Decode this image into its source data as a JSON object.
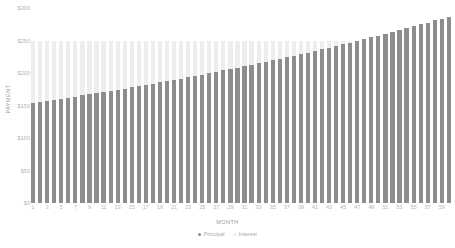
{
  "chart_data": {
    "type": "bar",
    "subtype": "stacked-bar",
    "title": "",
    "xlabel": "MONTH",
    "ylabel": "PAYMENT",
    "ylim": [
      0,
      300
    ],
    "y_ticks": [
      0,
      50,
      100,
      150,
      200,
      250,
      300
    ],
    "y_tick_labels": [
      "$0",
      "$50",
      "$100",
      "$150",
      "$200",
      "$250",
      "$300"
    ],
    "grid": false,
    "legend_position": "bottom-center",
    "legend": [
      "Principal",
      "Interest"
    ],
    "x_tick_labels": [
      "1",
      "3",
      "5",
      "7",
      "9",
      "11",
      "13",
      "15",
      "17",
      "19",
      "21",
      "23",
      "25",
      "27",
      "29",
      "31",
      "33",
      "35",
      "37",
      "39",
      "41",
      "43",
      "45",
      "47",
      "49",
      "51",
      "53",
      "55",
      "57",
      "59"
    ],
    "categories": [
      1,
      2,
      3,
      4,
      5,
      6,
      7,
      8,
      9,
      10,
      11,
      12,
      13,
      14,
      15,
      16,
      17,
      18,
      19,
      20,
      21,
      22,
      23,
      24,
      25,
      26,
      27,
      28,
      29,
      30,
      31,
      32,
      33,
      34,
      35,
      36,
      37,
      38,
      39,
      40,
      41,
      42,
      43,
      44,
      45,
      46,
      47,
      48,
      49,
      50,
      51,
      52,
      53,
      54,
      55,
      56,
      57,
      58,
      59,
      60
    ],
    "series": [
      {
        "name": "Principal",
        "color": "#8d8d8d",
        "values": [
          154.0,
          155.6,
          157.2,
          158.8,
          160.4,
          162.1,
          163.8,
          165.5,
          167.2,
          168.9,
          170.7,
          172.5,
          174.3,
          176.1,
          177.9,
          179.8,
          181.7,
          183.6,
          185.5,
          187.5,
          189.4,
          191.4,
          193.4,
          195.5,
          197.5,
          199.6,
          201.7,
          203.9,
          206.0,
          208.2,
          210.4,
          212.7,
          214.9,
          217.2,
          219.5,
          221.9,
          224.2,
          226.6,
          229.0,
          231.5,
          233.9,
          236.4,
          239.0,
          241.5,
          244.1,
          246.7,
          249.4,
          252.1,
          254.8,
          257.5,
          260.3,
          263.1,
          266.0,
          268.9,
          271.8,
          274.7,
          277.7,
          280.8,
          283.8,
          286.9
        ]
      },
      {
        "name": "Interest",
        "color": "#ededed",
        "values": [
          96.0,
          94.4,
          92.8,
          91.2,
          89.6,
          87.9,
          86.2,
          84.5,
          82.8,
          81.1,
          79.3,
          77.5,
          75.7,
          73.9,
          72.1,
          70.2,
          68.3,
          66.4,
          64.5,
          62.5,
          60.6,
          58.6,
          56.6,
          54.5,
          52.5,
          50.4,
          48.3,
          46.1,
          44.0,
          41.8,
          39.6,
          37.3,
          35.1,
          32.8,
          30.5,
          28.1,
          25.8,
          23.4,
          21.0,
          18.5,
          16.1,
          13.6,
          11.0,
          8.5,
          5.9,
          3.3,
          0.6,
          0.0,
          0.0,
          0.0,
          0.0,
          0.0,
          0.0,
          0.0,
          0.0,
          0.0,
          0.0,
          0.0,
          0.0,
          0.0
        ]
      }
    ],
    "totals": [
      250.0,
      250.0,
      250.0,
      250.0,
      250.0,
      250.0,
      250.0,
      250.0,
      250.0,
      250.0,
      250.0,
      250.0,
      250.0,
      250.0,
      250.0,
      250.0,
      250.0,
      250.0,
      250.0,
      250.0,
      250.0,
      250.0,
      250.0,
      250.0,
      250.0,
      250.0,
      250.0,
      250.0,
      250.0,
      250.0,
      250.0,
      250.0,
      250.0,
      250.0,
      250.0,
      250.0,
      250.0,
      250.0,
      250.0,
      250.0,
      250.0,
      250.0,
      250.0,
      250.0,
      250.0,
      250.0,
      250.0,
      252.1,
      254.8,
      257.5,
      260.3,
      263.1,
      266.0,
      268.9,
      271.8,
      274.7,
      277.7,
      280.8,
      283.8,
      286.9
    ]
  },
  "colors": {
    "principal": "#8d8d8d",
    "interest": "#ededed",
    "axis_text": "#b4b4b4",
    "axis_title": "#9a9a9a",
    "background": "#ffffff"
  }
}
